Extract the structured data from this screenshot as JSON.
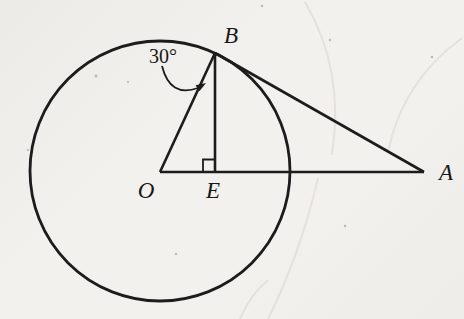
{
  "figure": {
    "labels": {
      "O": "O",
      "B": "B",
      "E": "E",
      "A": "A"
    },
    "angle_label": "30°",
    "colors": {
      "ink": "#1c1c1c",
      "paper": "#f2f1ed"
    },
    "geometry": {
      "circle": {
        "cx": 160,
        "cy": 171,
        "r": 130
      },
      "points": {
        "O": [
          160,
          172
        ],
        "B": [
          215,
          53
        ],
        "E": [
          215,
          172
        ],
        "A": [
          424,
          172
        ]
      },
      "segments": [
        {
          "name": "segment-OA",
          "from": "O",
          "to": "A"
        },
        {
          "name": "segment-OB",
          "from": "O",
          "to": "B"
        },
        {
          "name": "segment-BE",
          "from": "B",
          "to": "E"
        },
        {
          "name": "segment-BA",
          "from": "B",
          "to": "A"
        }
      ],
      "right_angle_at": "E",
      "marked_angle_vertex": "B",
      "marked_angle_value": "30°"
    }
  }
}
